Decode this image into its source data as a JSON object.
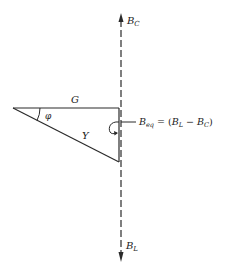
{
  "diagram": {
    "type": "admittance-triangle",
    "labels": {
      "top_axis": {
        "main": "B",
        "sub": "C"
      },
      "bottom_axis": {
        "main": "B",
        "sub": "L"
      },
      "horizontal_side": "G",
      "hypotenuse": "Y",
      "angle": "φ",
      "equivalent": {
        "main": "B",
        "sub": "eq",
        "eq": " = (",
        "t1_main": "B",
        "t1_sub": "L",
        "minus": " − ",
        "t2_main": "B",
        "t2_sub": "C",
        "close": ")"
      }
    },
    "colors": {
      "line": "#2a2a2a",
      "background": "#ffffff"
    }
  }
}
